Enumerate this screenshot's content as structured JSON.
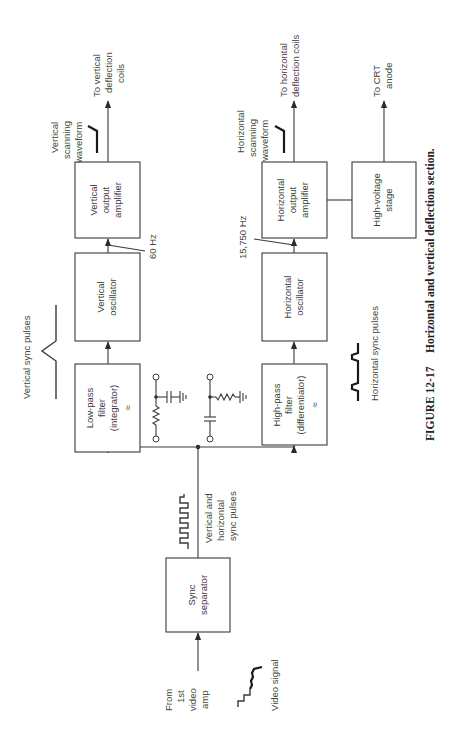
{
  "figure": {
    "number": "FIGURE 12-17",
    "title": "Horizontal and vertical deflection section."
  },
  "blocks": {
    "sync_separator": [
      "Sync",
      "separator"
    ],
    "low_pass_filter": [
      "Low-pass",
      "filter",
      "(integrator)",
      "≈"
    ],
    "vertical_oscillator": [
      "Vertical",
      "oscillator"
    ],
    "vertical_output_amplifier": [
      "Vertical",
      "output",
      "amplifier"
    ],
    "high_pass_filter": [
      "High-pass",
      "filter",
      "(differentiator)",
      "≈"
    ],
    "horizontal_oscillator": [
      "Horizontal",
      "oscillator"
    ],
    "horizontal_output_amplifier": [
      "Horizontal",
      "output",
      "amplifier"
    ],
    "high_voltage_stage": [
      "High-voltage",
      "stage"
    ]
  },
  "labels": {
    "input_source": [
      "From",
      "1st",
      "video",
      "amp"
    ],
    "video_signal": "Video signal",
    "combined_sync": [
      "Vertical and",
      "horizontal",
      "sync pulses"
    ],
    "vertical_sync_pulses": "Vertical sync pulses",
    "horizontal_sync_pulses": "Horizontal sync pulses",
    "vertical_frequency": "60 Hz",
    "horizontal_frequency": "15,750 Hz",
    "vertical_scanning_waveform": [
      "Vertical",
      "scanning",
      "waveform"
    ],
    "horizontal_scanning_waveform": [
      "Horizontal",
      "scanning",
      "waveform"
    ],
    "to_vertical_coils": [
      "To vertical",
      "deflection",
      "coils"
    ],
    "to_horizontal_coils": [
      "To horizontal",
      "deflection coils"
    ],
    "to_crt_anode": [
      "To CRT",
      "anode"
    ]
  }
}
